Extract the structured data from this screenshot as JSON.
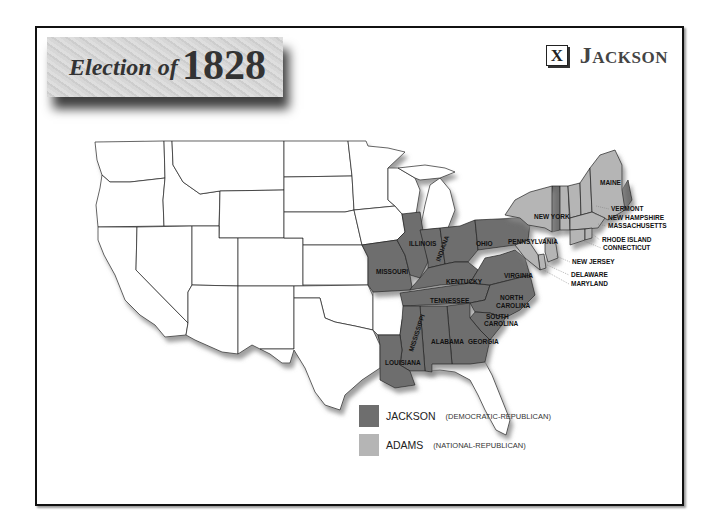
{
  "header": {
    "title_prefix": "Election of",
    "year": "1828",
    "winner_mark": "X",
    "winner": "Jackson"
  },
  "colors": {
    "jackson": "#6e6e6e",
    "adams": "#b5b5b5",
    "other": "#ffffff"
  },
  "legend": [
    {
      "name": "JACKSON",
      "party": "(DEMOCRATIC-REPUBLICAN)",
      "color": "#6e6e6e"
    },
    {
      "name": "ADAMS",
      "party": "(NATIONAL-REPUBLICAN)",
      "color": "#b5b5b5"
    }
  ],
  "state_labels": {
    "missouri": "MISSOURI",
    "illinois": "ILLINOIS",
    "indiana": "INDIANA",
    "ohio": "OHIO",
    "pennsylvania": "PENNSYLVANIA",
    "new_york": "NEW YORK",
    "maine": "MAINE",
    "kentucky": "KENTUCKY",
    "virginia": "VIRGINIA",
    "tennessee": "TENNESSEE",
    "north_carolina_1": "NORTH",
    "north_carolina_2": "CAROLINA",
    "south_carolina_1": "SOUTH",
    "south_carolina_2": "CAROLINA",
    "mississippi": "MISSISSIPPI",
    "alabama": "ALABAMA",
    "georgia": "GEORGIA",
    "louisiana": "LOUISIANA",
    "vermont": "VERMONT",
    "new_hampshire": "NEW HAMPSHIRE",
    "massachusetts": "MASSACHUSETTS",
    "rhode_island": "RHODE ISLAND",
    "connecticut": "CONNECTICUT",
    "new_jersey": "NEW JERSEY",
    "delaware": "DELAWARE",
    "maryland": "MARYLAND"
  },
  "results": {
    "jackson_states": [
      "Missouri",
      "Illinois",
      "Indiana",
      "Ohio",
      "Pennsylvania",
      "Kentucky",
      "Virginia",
      "Tennessee",
      "North Carolina",
      "South Carolina",
      "Georgia",
      "Alabama",
      "Mississippi",
      "Louisiana",
      "New York (split)",
      "Maine (split)"
    ],
    "adams_states": [
      "Vermont",
      "New Hampshire",
      "Massachusetts",
      "Rhode Island",
      "Connecticut",
      "New Jersey",
      "Delaware",
      "Maryland (split)",
      "New York (split)",
      "Maine (split)"
    ]
  }
}
